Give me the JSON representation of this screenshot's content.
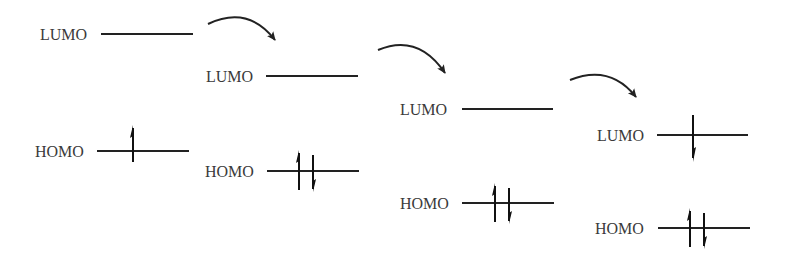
{
  "diagram": {
    "type": "molecular-orbital-energy-levels",
    "colors": {
      "line": "#222222",
      "text": "#3a3a3a",
      "background": "#ffffff"
    },
    "stages": [
      {
        "lumo": {
          "label": "LUMO",
          "electrons": []
        },
        "homo": {
          "label": "HOMO",
          "electrons": [
            "up"
          ]
        }
      },
      {
        "lumo": {
          "label": "LUMO",
          "electrons": []
        },
        "homo": {
          "label": "HOMO",
          "electrons": [
            "up",
            "down"
          ]
        }
      },
      {
        "lumo": {
          "label": "LUMO",
          "electrons": []
        },
        "homo": {
          "label": "HOMO",
          "electrons": [
            "up",
            "down"
          ]
        }
      },
      {
        "lumo": {
          "label": "LUMO",
          "electrons": [
            "down"
          ]
        },
        "homo": {
          "label": "HOMO",
          "electrons": [
            "up",
            "down"
          ]
        }
      }
    ],
    "transition_arrows": 3
  }
}
